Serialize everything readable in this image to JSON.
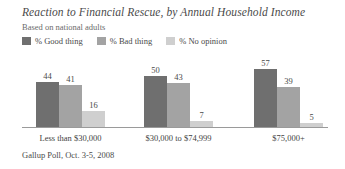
{
  "chart_data": {
    "type": "bar",
    "title": "Reaction to Financial Rescue, by Annual Household Income",
    "subtitle": "Based on national adults",
    "source": "Gallup Poll, Oct. 3-5, 2008",
    "xlabel": "",
    "ylabel": "",
    "ylim": [
      0,
      70
    ],
    "grid": false,
    "legend_position": "top-left",
    "categories": [
      "Less than $30,000",
      "$30,000 to $74,999",
      "$75,000+"
    ],
    "series": [
      {
        "name": "% Good thing",
        "color": "#6f6f6f",
        "values": [
          44,
          50,
          57
        ]
      },
      {
        "name": "% Bad thing",
        "color": "#a3a3a3",
        "values": [
          41,
          43,
          39
        ]
      },
      {
        "name": "% No opinion",
        "color": "#cfcfcf",
        "values": [
          16,
          7,
          5
        ]
      }
    ]
  },
  "axis": {
    "baseline_color": "#9a9a9a"
  }
}
